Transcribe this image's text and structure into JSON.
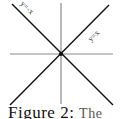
{
  "diagram": {
    "lines": [
      {
        "id": "y_eq_neg_x",
        "label": "y=-x",
        "color": "#111111"
      },
      {
        "id": "y_eq_x",
        "label": "y=x",
        "color": "#111111"
      }
    ],
    "axes_color": "#8a8a8a"
  },
  "caption": {
    "figure": "Figure 2:",
    "rest": "The"
  }
}
